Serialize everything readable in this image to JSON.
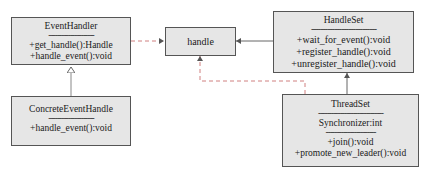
{
  "diagram": {
    "type": "uml-class-diagram",
    "classes": [
      {
        "id": "event-handler",
        "name": "EventHandler",
        "separator": "---------------------",
        "attributes": [],
        "methods": [
          "+get_handle():Handle",
          "+handle_event():void"
        ]
      },
      {
        "id": "concrete-event-handle",
        "name": "ConcreteEventHandle",
        "separator": "---------------------",
        "attributes": [],
        "methods": [
          "+handle_event():void"
        ]
      },
      {
        "id": "handle",
        "name": "handle",
        "attributes": [],
        "methods": []
      },
      {
        "id": "handle-set",
        "name": "HandleSet",
        "separator": "----------------------------",
        "attributes": [],
        "methods": [
          "+wait_for_event():void",
          "+register_handle():void",
          "+unregister_handle():void"
        ]
      },
      {
        "id": "thread-set",
        "name": "ThreadSet",
        "separator": "------------------------------",
        "separator2": "-----------------------",
        "attributes": [
          "Synchronizer:int"
        ],
        "methods": [
          "+join():void",
          "+promote_new_leader():void"
        ]
      }
    ],
    "relations": [
      {
        "from": "ConcreteEventHandle",
        "to": "EventHandler",
        "type": "inheritance",
        "style": "solid",
        "arrow": "hollow-triangle"
      },
      {
        "from": "EventHandler",
        "to": "handle",
        "type": "dependency",
        "style": "dashed",
        "arrow": "open"
      },
      {
        "from": "HandleSet",
        "to": "handle",
        "type": "association",
        "style": "solid",
        "arrow": "open"
      },
      {
        "from": "ThreadSet",
        "to": "handle",
        "type": "dependency",
        "style": "dashed",
        "arrow": "open"
      },
      {
        "from": "ThreadSet",
        "to": "HandleSet",
        "type": "association",
        "style": "solid",
        "arrow": "open"
      }
    ],
    "colors": {
      "box_fill": "#e6e6e6",
      "box_border": "#555555",
      "dashed_line": "#d08080",
      "solid_line": "#666666"
    }
  }
}
